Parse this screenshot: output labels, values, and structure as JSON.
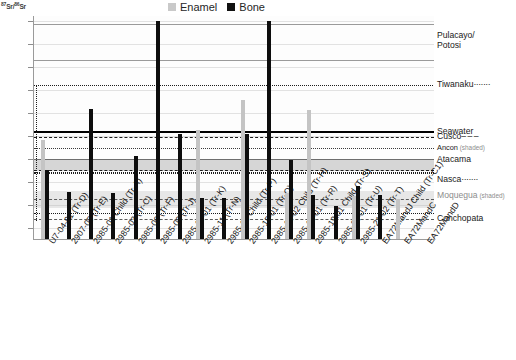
{
  "axis": {
    "y_title": "87Sr/86Sr",
    "y_title_sup1": "87",
    "y_title_mid": "Sr/",
    "y_title_sup2": "86",
    "y_title_end": "Sr",
    "y_ticks": [
      ".7140",
      ".7130",
      ".7120",
      ".7110",
      ".7100",
      ".7090",
      ".7080",
      ".7070",
      ".7060",
      ".7050"
    ],
    "y_min": 0.7045,
    "y_max": 0.7142
  },
  "legend": {
    "items": [
      {
        "label": "Enamel",
        "color": "#c9c9c9",
        "key": "enamel"
      },
      {
        "label": "Bone",
        "color": "#111111",
        "key": "bone"
      }
    ]
  },
  "annotations": [
    {
      "label": "Pulacayo/",
      "label2": "Potosi",
      "value": 0.7131,
      "style": "two-line"
    },
    {
      "label": "Tiwanaku",
      "trail": "·······",
      "value": 0.7112,
      "style": "normal"
    },
    {
      "label": "Seawater",
      "value": 0.70915,
      "style": "normal"
    },
    {
      "label": "Cusco",
      "trail": "– – –",
      "value": 0.70895,
      "style": "normal"
    },
    {
      "label": "Ancon",
      "sub": "(shaded)",
      "value": 0.70845,
      "style": "small"
    },
    {
      "label": "Atacama",
      "value": 0.70795,
      "style": "normal"
    },
    {
      "label": "Nasca",
      "trail": "·······",
      "value": 0.70705,
      "style": "normal"
    },
    {
      "label": "Moquegua",
      "sub": "(shaded)",
      "value": 0.70635,
      "style": "gray"
    },
    {
      "label": "Conchopata",
      "value": 0.70535,
      "style": "normal"
    }
  ],
  "chart_data": {
    "type": "bar",
    "title": "",
    "xlabel": "",
    "ylabel": "87Sr/86Sr",
    "ylim": [
      0.7045,
      0.7142
    ],
    "grid": true,
    "legend_position": "top-center",
    "categories": [
      "U7-04-01 (Tr-D)",
      "2907-05 (Tr-E)",
      "2985-01 Child (Tr-A)",
      "2985-03 (Tr-C)",
      "2985-06 (Tr-F)",
      "2985-09 (Tr-J)",
      "2985-10-01 (Tr-K)",
      "2985-11 (Tr-N)",
      "2985-13 Child (Tr-P)",
      "2985-15-01 (Tr-Q)",
      "2985-15-02 Child (Tr-H)",
      "2985-18-01 (Tr-R)",
      "2985-19.01 Child (Tr-S)",
      "2985-21-01 (Tr-U)",
      "2985-21-02 (Tr-T)",
      "EA72MandJ Child (Tr-C1)",
      "EA72MandC",
      "EA72MandD"
    ],
    "series": [
      {
        "name": "Enamel",
        "color": "#c4c4c4",
        "values": [
          0.7088,
          null,
          null,
          null,
          null,
          null,
          null,
          0.70925,
          null,
          0.71055,
          null,
          0.7065,
          0.7101,
          null,
          0.70635,
          null,
          0.70625,
          null
        ]
      },
      {
        "name": "Bone",
        "color": "#0d0d0d",
        "values": [
          0.7075,
          0.70655,
          0.71015,
          0.7065,
          0.7081,
          0.714,
          0.70905,
          0.7063,
          0.7063,
          0.70905,
          0.714,
          0.70795,
          0.7064,
          0.70595,
          0.7068,
          0.7064,
          null,
          null
        ]
      }
    ],
    "reference_bands": [
      {
        "name": "Pulacayo/Potosi",
        "low": 0.71235,
        "high": 0.71385,
        "style": "box-outline",
        "color": "#9a9a9a"
      },
      {
        "name": "Tiwanaku",
        "low": 0.7056,
        "high": 0.7112,
        "style": "dotted-box",
        "color": "#1c1c1c"
      },
      {
        "name": "Seawater",
        "value": 0.70918,
        "style": "solid-thick",
        "color": "#000000"
      },
      {
        "name": "Cusco",
        "value": 0.70895,
        "style": "dashed",
        "color": "#1c1c1c"
      },
      {
        "name": "Ancon",
        "low": 0.7079,
        "high": 0.70845,
        "style": "dotted-shaded",
        "color": "#3a3a3a"
      },
      {
        "name": "Atacama",
        "low": 0.70745,
        "high": 0.708,
        "style": "shaded-band",
        "color": "#969696"
      },
      {
        "name": "Nasca",
        "low": 0.7056,
        "high": 0.70735,
        "style": "dotted",
        "color": "#1c1c1c"
      },
      {
        "name": "Moquegua",
        "low": 0.70585,
        "high": 0.7066,
        "style": "shaded-band",
        "color": "#afafaf"
      },
      {
        "name": "Conchopata",
        "low": 0.7053,
        "high": 0.70555,
        "style": "dashed-thin",
        "color": "#5a5a5a"
      }
    ]
  }
}
